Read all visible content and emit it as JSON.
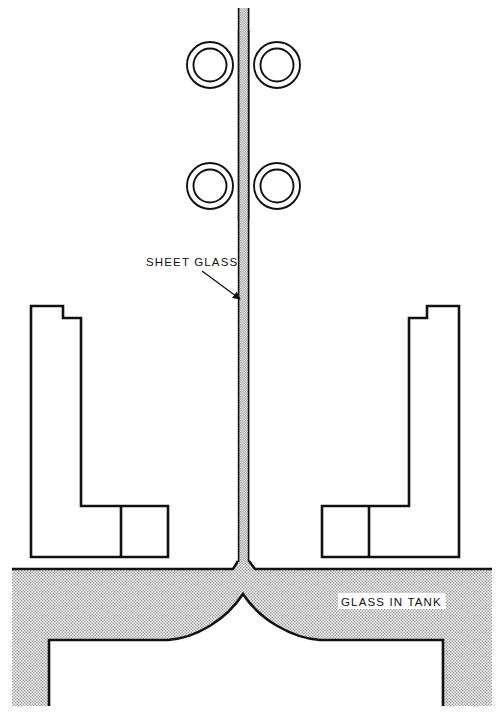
{
  "diagram": {
    "canvas": {
      "width": 503,
      "height": 715
    },
    "background_color": "#ffffff",
    "line_color": "#111111",
    "stipple_color": "#cfcfcf",
    "labels": [
      {
        "id": "sheet-glass",
        "text": "SHEET GLASS",
        "x": 146,
        "y": 266,
        "has_leader_arrow": true,
        "arrow_from": [
          202,
          271
        ],
        "arrow_to": [
          243,
          301
        ]
      },
      {
        "id": "glass-in-tank",
        "text": "GLASS IN TANK",
        "x": 341,
        "y": 606,
        "has_leader_arrow": false,
        "boxed": true
      }
    ],
    "rollers": {
      "count": 4,
      "outer_radius": 23,
      "inner_radius": 17,
      "pairs": [
        {
          "label": "upper-roller-pair",
          "cy": 65,
          "left_cx": 210,
          "right_cx": 277
        },
        {
          "label": "lower-roller-pair",
          "cy": 186,
          "left_cx": 210,
          "right_cx": 277
        }
      ]
    },
    "sheet_glass_ribbon": {
      "left_edge_x": 238,
      "right_edge_x": 249,
      "top_y": 8,
      "bottom_y": 569,
      "fill": "stipple"
    },
    "machine_blocks": [
      {
        "id": "left-machine-block",
        "side": "left"
      },
      {
        "id": "right-machine-block",
        "side": "right"
      }
    ],
    "tank": {
      "id": "glass-tank",
      "top_y": 569,
      "bottom_y": 700,
      "left_x": 12,
      "right_x": 492,
      "dome_peak": [
        243,
        594
      ],
      "shelf_y": 640
    }
  }
}
